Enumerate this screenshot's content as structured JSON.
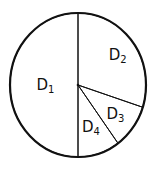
{
  "chart_data": {
    "type": "pie",
    "title": "",
    "start": "top",
    "direction": "clockwise",
    "slices": [
      {
        "name": "D2",
        "base": "D",
        "sub": "2",
        "value": 30
      },
      {
        "name": "D3",
        "base": "D",
        "sub": "3",
        "value": 10
      },
      {
        "name": "D4",
        "base": "D",
        "sub": "4",
        "value": 10
      },
      {
        "name": "D1",
        "base": "D",
        "sub": "1",
        "value": 50
      }
    ],
    "fill": "#ffffff",
    "stroke": "#111111"
  }
}
